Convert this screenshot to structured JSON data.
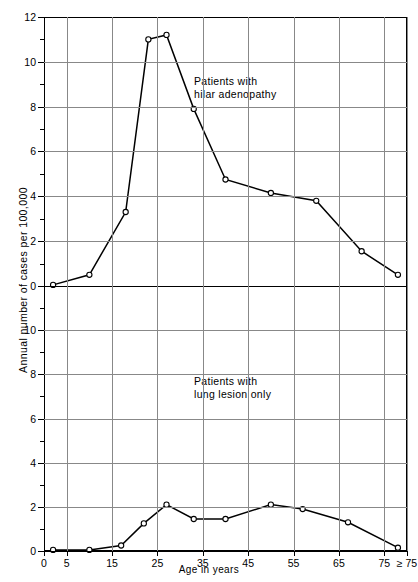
{
  "chart_data": [
    {
      "type": "line",
      "panel": "top",
      "title": "",
      "annotation": [
        "Patients with",
        "hilar adenopathy"
      ],
      "xlabel": "Age in years",
      "ylabel": "Annual number of cases per 100,000",
      "grid": true,
      "legend": "none",
      "xlim": [
        0,
        80
      ],
      "ylim": [
        0,
        12
      ],
      "yticks": [
        0,
        2,
        4,
        6,
        8,
        10,
        12
      ],
      "yminorticks": [
        1,
        3,
        5,
        7,
        9,
        11
      ],
      "xticks": [
        0,
        5,
        15,
        25,
        35,
        45,
        55,
        65,
        75,
        80
      ],
      "xticklabels": [
        "0",
        "5",
        "15",
        "25",
        "35",
        "45",
        "55",
        "65",
        "75",
        "≥ 75"
      ],
      "x": [
        2,
        10,
        18,
        23,
        27,
        33,
        40,
        50,
        60,
        70,
        78
      ],
      "values": [
        0.05,
        0.5,
        3.3,
        11.0,
        11.2,
        7.9,
        4.75,
        4.15,
        3.8,
        1.55,
        0.5
      ]
    },
    {
      "type": "line",
      "panel": "bottom",
      "title": "",
      "annotation": [
        "Patients with",
        "lung lesion only"
      ],
      "xlabel": "Age in years",
      "ylabel": "Annual number of cases per 100,000",
      "grid": true,
      "legend": "none",
      "xlim": [
        0,
        80
      ],
      "ylim": [
        0,
        12
      ],
      "yticks": [
        0,
        2,
        4,
        6,
        8,
        10
      ],
      "yminorticks": [
        1,
        3,
        5,
        7,
        9,
        11
      ],
      "xticks": [
        0,
        5,
        15,
        25,
        35,
        45,
        55,
        65,
        75,
        80
      ],
      "xticklabels": [
        "0",
        "5",
        "15",
        "25",
        "35",
        "45",
        "55",
        "65",
        "75",
        "≥ 75"
      ],
      "x": [
        2,
        10,
        17,
        22,
        27,
        33,
        40,
        50,
        57,
        67,
        78
      ],
      "values": [
        0.05,
        0.05,
        0.25,
        1.25,
        2.1,
        1.45,
        1.45,
        2.1,
        1.9,
        1.3,
        0.15
      ]
    }
  ],
  "figure": {
    "ylabel": "Annual number of cases per 100,000",
    "xlabel": "Age in years",
    "annotation_top_line1": "Patients with",
    "annotation_top_line2": "hilar adenopathy",
    "annotation_bottom_line1": "Patients with",
    "annotation_bottom_line2": "lung lesion only",
    "colors": {
      "line": "#000000",
      "marker_fill": "#ffffff",
      "grid": "#888888",
      "axis": "#000000",
      "background": "#ffffff"
    }
  }
}
